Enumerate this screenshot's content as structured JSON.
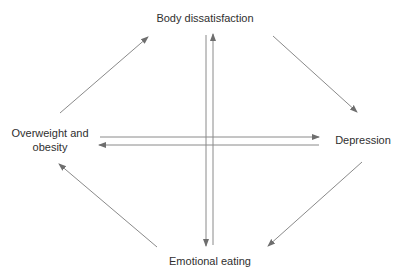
{
  "diagram": {
    "type": "cycle-diagram",
    "nodes": [
      {
        "id": "body",
        "label": "Body dissatisfaction",
        "position": "top"
      },
      {
        "id": "depression",
        "label": "Depression",
        "position": "right"
      },
      {
        "id": "emotional",
        "label": "Emotional eating",
        "position": "bottom"
      },
      {
        "id": "overweight",
        "label": "Overweight and obesity",
        "position": "left"
      }
    ],
    "edges": [
      {
        "from": "overweight",
        "to": "body",
        "style": "diagonal"
      },
      {
        "from": "body",
        "to": "depression",
        "style": "diagonal"
      },
      {
        "from": "depression",
        "to": "emotional",
        "style": "diagonal"
      },
      {
        "from": "emotional",
        "to": "overweight",
        "style": "diagonal"
      },
      {
        "from": "body",
        "to": "emotional",
        "style": "vertical"
      },
      {
        "from": "emotional",
        "to": "body",
        "style": "vertical"
      },
      {
        "from": "overweight",
        "to": "depression",
        "style": "horizontal"
      },
      {
        "from": "depression",
        "to": "overweight",
        "style": "horizontal"
      }
    ],
    "colors": {
      "line": "#8a8a8a",
      "arrowhead": "#6e6e6e",
      "text": "#2f2f2f",
      "background": "#ffffff"
    }
  },
  "labels": {
    "body": "Body dissatisfaction",
    "depression": "Depression",
    "emotional": "Emotional eating",
    "overweight": "Overweight and obesity"
  }
}
